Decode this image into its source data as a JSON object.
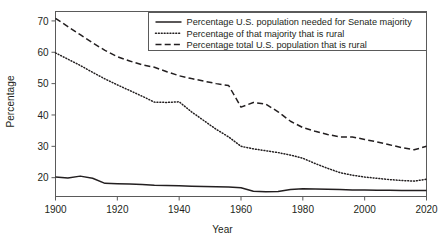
{
  "chart_data": {
    "type": "line",
    "title": "",
    "xlabel": "Year",
    "ylabel": "Percentage",
    "xlim": [
      1900,
      2020
    ],
    "ylim": [
      14,
      73
    ],
    "grid": false,
    "legend_position": "top-right",
    "xticks": [
      1900,
      1920,
      1940,
      1960,
      1980,
      2000,
      2020
    ],
    "yticks": [
      20,
      30,
      40,
      50,
      60,
      70
    ],
    "xtick_labels": [
      "1900",
      "1920",
      "1940",
      "1960",
      "1980",
      "2000",
      "2020"
    ],
    "ytick_labels": [
      "20",
      "30",
      "40",
      "50",
      "60",
      "70"
    ],
    "series": [
      {
        "name": "Percentage U.S. population needed for Senate majority",
        "style": "solid",
        "x": [
          1900,
          1904,
          1908,
          1912,
          1916,
          1920,
          1924,
          1928,
          1932,
          1936,
          1940,
          1944,
          1948,
          1952,
          1956,
          1960,
          1964,
          1968,
          1972,
          1976,
          1980,
          1984,
          1988,
          1992,
          1996,
          2000,
          2004,
          2008,
          2012,
          2016,
          2020
        ],
        "values": [
          20.2,
          19.9,
          20.5,
          19.8,
          18.2,
          18.1,
          18.0,
          17.8,
          17.6,
          17.5,
          17.4,
          17.3,
          17.2,
          17.1,
          17.0,
          16.8,
          15.7,
          15.5,
          15.6,
          16.2,
          16.5,
          16.4,
          16.3,
          16.2,
          16.1,
          16.1,
          16.0,
          16.0,
          15.9,
          15.9,
          15.9
        ]
      },
      {
        "name": "Percentage of that majority that is rural",
        "style": "dotted",
        "x": [
          1900,
          1904,
          1908,
          1912,
          1916,
          1920,
          1924,
          1928,
          1932,
          1936,
          1940,
          1944,
          1948,
          1952,
          1956,
          1960,
          1964,
          1968,
          1972,
          1976,
          1980,
          1984,
          1988,
          1992,
          1996,
          2000,
          2004,
          2008,
          2012,
          2016,
          2020
        ],
        "values": [
          59.8,
          57.8,
          55.8,
          53.6,
          51.5,
          49.6,
          47.8,
          46.0,
          44.1,
          44.0,
          44.2,
          41.0,
          38.2,
          35.4,
          33.0,
          30.0,
          29.2,
          28.6,
          28.0,
          27.2,
          26.2,
          24.5,
          23.0,
          21.6,
          20.8,
          20.2,
          19.8,
          19.4,
          19.1,
          18.9,
          19.5
        ]
      },
      {
        "name": "Percentage total U.S. population that is rural",
        "style": "dashed",
        "x": [
          1900,
          1904,
          1908,
          1912,
          1916,
          1920,
          1924,
          1928,
          1932,
          1936,
          1940,
          1944,
          1948,
          1952,
          1956,
          1960,
          1964,
          1968,
          1972,
          1976,
          1980,
          1984,
          1988,
          1992,
          1996,
          2000,
          2004,
          2008,
          2012,
          2016,
          2020
        ],
        "values": [
          70.8,
          68.2,
          65.6,
          63.0,
          60.6,
          58.6,
          57.2,
          56.0,
          55.2,
          53.8,
          52.5,
          51.6,
          50.8,
          50.0,
          49.4,
          42.5,
          44.0,
          43.5,
          41.0,
          38.0,
          36.0,
          34.8,
          33.8,
          33.0,
          33.0,
          32.2,
          31.4,
          30.5,
          29.6,
          28.9,
          30.0
        ]
      }
    ],
    "legend_entries": [
      {
        "label": "Percentage U.S. population needed for Senate majority",
        "style": "solid"
      },
      {
        "label": "Percentage of that majority that is rural",
        "style": "dotted"
      },
      {
        "label": "Percentage total U.S. population that is rural",
        "style": "dashed"
      }
    ]
  },
  "colors": {
    "line": "#231f20",
    "frame": "#5a5a5a",
    "background": "#ffffff"
  }
}
